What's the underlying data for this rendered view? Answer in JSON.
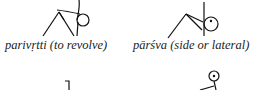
{
  "figures": [
    {
      "term": "parivṛtti (to revolve)",
      "icon": "stick-figure-revolved"
    },
    {
      "term": "pārśva (side or lateral)",
      "icon": "stick-figure-lateral"
    }
  ]
}
